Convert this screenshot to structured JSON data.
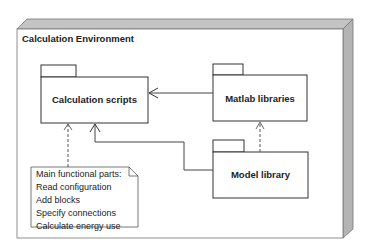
{
  "diagram": {
    "type": "UML deployment/package diagram",
    "node": {
      "title": "Calculation Environment"
    },
    "packages": [
      {
        "id": "calc",
        "name": "Calculation scripts"
      },
      {
        "id": "matlab",
        "name": "Matlab libraries"
      },
      {
        "id": "model",
        "name": "Model library"
      }
    ],
    "note": {
      "lines": [
        "Main functional parts:",
        "Read configuration",
        "Add blocks",
        "Specify connections",
        "Calculate energy use"
      ]
    },
    "relations": [
      {
        "from": "matlab",
        "to": "calc",
        "style": "solid",
        "arrow": "open"
      },
      {
        "from": "model",
        "to": "matlab",
        "style": "dashed",
        "arrow": "open"
      },
      {
        "from": "model",
        "to": "calc",
        "style": "solid",
        "arrow": "open"
      },
      {
        "from": "note",
        "to": "calc",
        "style": "dashed",
        "arrow": "open"
      }
    ],
    "colors": {
      "line": "#555555",
      "node_side": "#b8b8b8",
      "node_top": "#c8c8c8",
      "fill": "#ffffff"
    }
  }
}
